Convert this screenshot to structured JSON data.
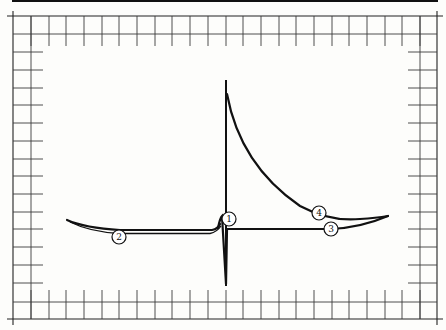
{
  "figure": {
    "type": "waveform-diagram",
    "colors": {
      "background": "#fdfdfb",
      "line": "#111111",
      "grid": "#3a3a3a"
    }
  },
  "labels": [
    {
      "id": "1",
      "text": "1",
      "x": 229,
      "y": 219
    },
    {
      "id": "2",
      "text": "2",
      "x": 119,
      "y": 237
    },
    {
      "id": "3",
      "text": "3",
      "x": 331,
      "y": 229
    },
    {
      "id": "4",
      "text": "4",
      "x": 319,
      "y": 213
    }
  ],
  "grid": {
    "outer": {
      "left": 13,
      "right": 437,
      "top": 16,
      "bottom": 319
    },
    "inner": {
      "left": 31,
      "right": 420,
      "top": 34,
      "bottom": 302
    },
    "top_ticks_x": [
      31,
      49,
      66,
      84,
      102,
      119,
      137,
      155,
      172,
      190,
      208,
      226,
      243,
      261,
      279,
      296,
      314,
      332,
      349,
      367,
      385,
      402,
      420
    ],
    "side_ticks_y": [
      52,
      70,
      88,
      105,
      123,
      141,
      159,
      176,
      194,
      212,
      229,
      247,
      265,
      283
    ]
  },
  "curves": {
    "vertical_axis": {
      "x": 226,
      "y_top": 80,
      "y_bottom": 286
    },
    "baseline_y": 229
  }
}
